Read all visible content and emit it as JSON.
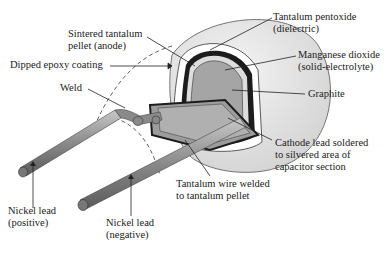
{
  "labels": {
    "sintered": {
      "line1": "Sintered tantalum",
      "line2": "pellet (anode)"
    },
    "epoxy": {
      "line1": "Dipped epoxy coating"
    },
    "weld": {
      "line1": "Weld"
    },
    "pentoxide": {
      "line1": "Tantalum pentoxide",
      "line2": "(dielectric)"
    },
    "manganese": {
      "line1": "Manganese dioxide",
      "line2": "(solid-electrolyte)"
    },
    "graphite": {
      "line1": "Graphite"
    },
    "cathode": {
      "line1": "Cathode lead soldered",
      "line2": "to silvered area of",
      "line3": "capacitor section"
    },
    "tantalum_wire": {
      "line1": "Tantalum wire welded",
      "line2": "to tantalum pellet"
    },
    "nickel_pos": {
      "line1": "Nickel lead",
      "line2": "(positive)"
    },
    "nickel_neg": {
      "line1": "Nickel lead",
      "line2": "(negative)"
    }
  },
  "colors": {
    "epoxy_shell": "#e4e4e4",
    "pellet": "#a8a8a8",
    "lead": "#8e8e8e",
    "outline": "#222222",
    "text": "#222222"
  }
}
